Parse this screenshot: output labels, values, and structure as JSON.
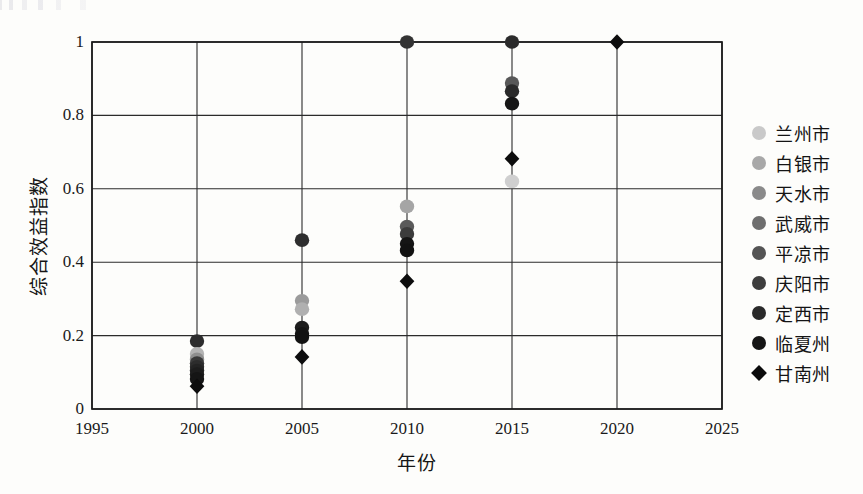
{
  "chart_data": {
    "type": "scatter",
    "title": "",
    "xlabel": "年份",
    "ylabel": "综合效益指数",
    "xlim": [
      1995,
      2025
    ],
    "ylim": [
      0,
      1
    ],
    "xticks": [
      "1995",
      "2000",
      "2005",
      "2010",
      "2015",
      "2020",
      "2025"
    ],
    "yticks": [
      "0",
      "0.2",
      "0.4",
      "0.6",
      "0.8",
      "1"
    ],
    "xtick_values": [
      1995,
      2000,
      2005,
      2010,
      2015,
      2020,
      2025
    ],
    "ytick_values": [
      0,
      0.2,
      0.4,
      0.6,
      0.8,
      1
    ],
    "grid": true,
    "legend_position": "right",
    "x": [
      2000,
      2005,
      2010,
      2015,
      2020
    ],
    "series": [
      {
        "name": "兰州市",
        "marker": "circle",
        "color": "#c9c9c9",
        "values": [
          0.15,
          0.29,
          0.55,
          0.62,
          null
        ]
      },
      {
        "name": "白银市",
        "marker": "circle",
        "color": "#a8a8a8",
        "values": [
          0.14,
          0.27,
          0.5,
          0.89,
          null
        ]
      },
      {
        "name": "天水市",
        "marker": "circle",
        "color": "#8a8a8a",
        "values": [
          0.13,
          0.22,
          0.49,
          0.87,
          null
        ]
      },
      {
        "name": "武威市",
        "marker": "circle",
        "color": "#6e6e6e",
        "values": [
          0.12,
          0.21,
          0.48,
          0.83,
          null
        ]
      },
      {
        "name": "平凉市",
        "marker": "circle",
        "color": "#545454",
        "values": [
          0.11,
          0.2,
          0.45,
          1.0,
          null
        ]
      },
      {
        "name": "庆阳市",
        "marker": "circle",
        "color": "#3d3d3d",
        "values": [
          0.1,
          0.46,
          0.43,
          1.0,
          null
        ]
      },
      {
        "name": "定西市",
        "marker": "circle",
        "color": "#2a2a2a",
        "values": [
          0.09,
          0.21,
          1.0,
          0.88,
          null
        ]
      },
      {
        "name": "临夏州",
        "marker": "circle",
        "color": "#151515",
        "values": [
          0.185,
          0.2,
          0.44,
          0.86,
          null
        ]
      },
      {
        "name": "甘南州",
        "marker": "diamond",
        "color": "#0b0b0b",
        "values": [
          0.06,
          0.14,
          0.35,
          0.68,
          1.0
        ]
      }
    ],
    "points": [
      {
        "series": "临夏州",
        "x": 2000,
        "y": 0.185,
        "marker": "circle",
        "color": "#2d2d2d"
      },
      {
        "series": "兰州市",
        "x": 2000,
        "y": 0.15,
        "marker": "circle",
        "color": "#b4b4b4"
      },
      {
        "series": "白银市",
        "x": 2000,
        "y": 0.135,
        "marker": "circle",
        "color": "#8f8f8f"
      },
      {
        "series": "天水市",
        "x": 2000,
        "y": 0.125,
        "marker": "circle",
        "color": "#3a3a3a"
      },
      {
        "series": "武威市",
        "x": 2000,
        "y": 0.115,
        "marker": "circle",
        "color": "#2c2c2c"
      },
      {
        "series": "平凉市",
        "x": 2000,
        "y": 0.105,
        "marker": "circle",
        "color": "#232323"
      },
      {
        "series": "庆阳市",
        "x": 2000,
        "y": 0.095,
        "marker": "circle",
        "color": "#1c1c1c"
      },
      {
        "series": "定西市",
        "x": 2000,
        "y": 0.082,
        "marker": "circle",
        "color": "#151515"
      },
      {
        "series": "甘南州",
        "x": 2000,
        "y": 0.062,
        "marker": "diamond",
        "color": "#0d0d0d"
      },
      {
        "series": "庆阳市",
        "x": 2005,
        "y": 0.46,
        "marker": "circle",
        "color": "#2e2e2e"
      },
      {
        "series": "兰州市",
        "x": 2005,
        "y": 0.295,
        "marker": "circle",
        "color": "#9b9b9b"
      },
      {
        "series": "白银市",
        "x": 2005,
        "y": 0.272,
        "marker": "circle",
        "color": "#b0b0b0"
      },
      {
        "series": "天水市",
        "x": 2005,
        "y": 0.222,
        "marker": "circle",
        "color": "#1d1d1d"
      },
      {
        "series": "武威市",
        "x": 2005,
        "y": 0.205,
        "marker": "circle",
        "color": "#151515"
      },
      {
        "series": "平凉市",
        "x": 2005,
        "y": 0.196,
        "marker": "circle",
        "color": "#121212"
      },
      {
        "series": "甘南州",
        "x": 2005,
        "y": 0.142,
        "marker": "diamond",
        "color": "#0d0d0d"
      },
      {
        "series": "定西市",
        "x": 2010,
        "y": 1.0,
        "marker": "circle",
        "color": "#333333"
      },
      {
        "series": "兰州市",
        "x": 2010,
        "y": 0.552,
        "marker": "circle",
        "color": "#a5a5a5"
      },
      {
        "series": "白银市",
        "x": 2010,
        "y": 0.497,
        "marker": "circle",
        "color": "#5a5a5a"
      },
      {
        "series": "天水市",
        "x": 2010,
        "y": 0.477,
        "marker": "circle",
        "color": "#3c3c3c"
      },
      {
        "series": "武威市",
        "x": 2010,
        "y": 0.45,
        "marker": "circle",
        "color": "#151515"
      },
      {
        "series": "平凉市",
        "x": 2010,
        "y": 0.432,
        "marker": "circle",
        "color": "#121212"
      },
      {
        "series": "甘南州",
        "x": 2010,
        "y": 0.348,
        "marker": "diamond",
        "color": "#0d0d0d"
      },
      {
        "series": "平凉市",
        "x": 2015,
        "y": 1.0,
        "marker": "circle",
        "color": "#2b2b2b"
      },
      {
        "series": "白银市",
        "x": 2015,
        "y": 0.888,
        "marker": "circle",
        "color": "#585858"
      },
      {
        "series": "天水市",
        "x": 2015,
        "y": 0.866,
        "marker": "circle",
        "color": "#2a2a2a"
      },
      {
        "series": "武威市",
        "x": 2015,
        "y": 0.832,
        "marker": "circle",
        "color": "#161616"
      },
      {
        "series": "甘南州",
        "x": 2015,
        "y": 0.682,
        "marker": "diamond",
        "color": "#0d0d0d"
      },
      {
        "series": "兰州市",
        "x": 2015,
        "y": 0.62,
        "marker": "circle",
        "color": "#cfcfcf"
      },
      {
        "series": "甘南州",
        "x": 2020,
        "y": 1.0,
        "marker": "diamond",
        "color": "#0d0d0d"
      }
    ]
  },
  "legend": {
    "items": [
      {
        "label": "兰州市",
        "marker": "circle",
        "color": "#c9c9c9"
      },
      {
        "label": "白银市",
        "marker": "circle",
        "color": "#a8a8a8"
      },
      {
        "label": "天水市",
        "marker": "circle",
        "color": "#8a8a8a"
      },
      {
        "label": "武威市",
        "marker": "circle",
        "color": "#6e6e6e"
      },
      {
        "label": "平凉市",
        "marker": "circle",
        "color": "#545454"
      },
      {
        "label": "庆阳市",
        "marker": "circle",
        "color": "#3d3d3d"
      },
      {
        "label": "定西市",
        "marker": "circle",
        "color": "#2a2a2a"
      },
      {
        "label": "临夏州",
        "marker": "circle",
        "color": "#151515"
      },
      {
        "label": "甘南州",
        "marker": "diamond",
        "color": "#0b0b0b"
      }
    ]
  },
  "colors": {
    "background": "#fdfdfb",
    "axis": "#1a1a1a",
    "grid": "#2b2b2b",
    "text": "#141414"
  }
}
